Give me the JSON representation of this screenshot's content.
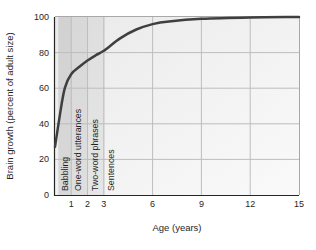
{
  "chart_data": {
    "type": "line",
    "title": "",
    "xlabel": "Age (years)",
    "ylabel": "Brain growth (percent of adult size)",
    "xlim": [
      0,
      15
    ],
    "ylim": [
      0,
      100
    ],
    "x_ticks": [
      1,
      2,
      3,
      6,
      9,
      12,
      15
    ],
    "y_ticks": [
      0,
      20,
      40,
      60,
      80,
      100
    ],
    "grid": true,
    "legend": "none",
    "series": [
      {
        "name": "Brain growth",
        "x": [
          0,
          0.3,
          0.6,
          1,
          1.5,
          2,
          2.5,
          3,
          4,
          5,
          6,
          7,
          9,
          12,
          15
        ],
        "y": [
          27,
          45,
          60,
          68,
          72,
          75.5,
          78.5,
          81,
          88,
          93,
          96,
          97.5,
          99,
          99.8,
          100
        ]
      }
    ],
    "milestone_bands": [
      {
        "label": "Babbling",
        "x_start": 0.2,
        "x_end": 1.0,
        "label_x": 0.62,
        "shade": 0.13
      },
      {
        "label": "One-word utterances",
        "x_start": 1.0,
        "x_end": 2.0,
        "label_x": 1.42,
        "shade": 0.1
      },
      {
        "label": "Two-word phrases",
        "x_start": 2.0,
        "x_end": 3.05,
        "label_x": 2.43,
        "shade": 0.065
      },
      {
        "label": "Sentences",
        "x_start": null,
        "x_end": null,
        "label_x": 3.42,
        "shade": 0
      }
    ],
    "colors": {
      "curve": "#3f3f3f",
      "grid": "#bdbdbd",
      "axis": "#262626",
      "border": "#a8a8a8",
      "plot_bg_start": "#eaeaea",
      "plot_bg_end": "#fafafa",
      "band_tint_rgb": "50,50,50",
      "text": "#1f1f1f"
    }
  }
}
